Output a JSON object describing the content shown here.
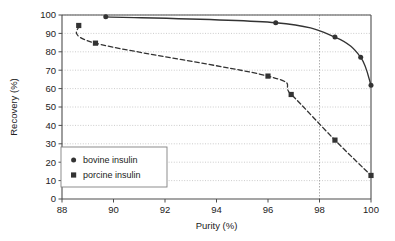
{
  "chart_data": {
    "type": "scatter",
    "title": "",
    "xlabel": "Purity (%)",
    "ylabel": "Recovery (%)",
    "xlim": [
      88,
      100
    ],
    "ylim": [
      0,
      100
    ],
    "xticks": [
      88,
      90,
      92,
      94,
      96,
      98,
      100
    ],
    "yticks": [
      0,
      10,
      20,
      30,
      40,
      50,
      60,
      70,
      80,
      90,
      100
    ],
    "grid": "horizontal-dotted-gray",
    "legend_position": "lower-left-inside",
    "annotations": [
      {
        "type": "vertical-reference-line",
        "x": 98,
        "style": "dotted"
      }
    ],
    "series": [
      {
        "name": "bovine insulin",
        "marker": "circle",
        "line": "solid",
        "color": "#333333",
        "points": [
          {
            "x": 89.7,
            "y": 99.0
          },
          {
            "x": 96.3,
            "y": 95.8
          },
          {
            "x": 98.6,
            "y": 88.0
          },
          {
            "x": 99.6,
            "y": 77.0
          },
          {
            "x": 100.0,
            "y": 61.8
          }
        ]
      },
      {
        "name": "porcine insulin",
        "marker": "square",
        "line": "dashed",
        "color": "#333333",
        "points": [
          {
            "x": 88.65,
            "y": 94.3
          },
          {
            "x": 89.3,
            "y": 84.7
          },
          {
            "x": 96.0,
            "y": 66.8
          },
          {
            "x": 96.9,
            "y": 56.8
          },
          {
            "x": 98.6,
            "y": 32.0
          },
          {
            "x": 100.0,
            "y": 12.8
          }
        ]
      }
    ]
  },
  "axes": {
    "x_title": "Purity (%)",
    "y_title": "Recovery (%)",
    "x_tick_labels": [
      "88",
      "90",
      "92",
      "94",
      "96",
      "98",
      "100"
    ],
    "y_tick_labels": [
      "0",
      "10",
      "20",
      "30",
      "40",
      "50",
      "60",
      "70",
      "80",
      "90",
      "100"
    ]
  },
  "legend": {
    "entries": [
      {
        "label": "bovine insulin",
        "marker": "circle-marker-icon"
      },
      {
        "label": "porcine insulin",
        "marker": "square-marker-icon"
      }
    ]
  },
  "colors": {
    "axis": "#4d4d4d",
    "grid": "#bfbfbf",
    "series": "#333333",
    "background": "#ffffff"
  }
}
